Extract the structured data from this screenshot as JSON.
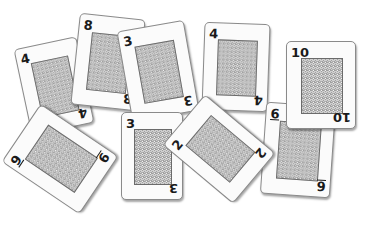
{
  "scene": {
    "description": "Scattered playing cards face-down showing rank numbers in corners",
    "background": "#ffffff"
  },
  "cards": [
    {
      "id": "card-4-left",
      "rank": "4",
      "x": 22,
      "y": 42,
      "w": 64,
      "h": 88,
      "rotate": -12,
      "z": 1
    },
    {
      "id": "card-8",
      "rank": "8",
      "x": 75,
      "y": 16,
      "w": 66,
      "h": 92,
      "rotate": 6,
      "z": 2
    },
    {
      "id": "card-3-top",
      "rank": "3",
      "x": 124,
      "y": 25,
      "w": 68,
      "h": 92,
      "rotate": -10,
      "z": 3
    },
    {
      "id": "card-4-right",
      "rank": "4",
      "x": 203,
      "y": 23,
      "w": 66,
      "h": 88,
      "rotate": 2,
      "z": 3
    },
    {
      "id": "card-6",
      "rank": "6",
      "x": 263,
      "y": 104,
      "w": 70,
      "h": 92,
      "rotate": 4,
      "z": 4
    },
    {
      "id": "card-10",
      "rank": "10",
      "x": 286,
      "y": 41,
      "w": 70,
      "h": 88,
      "rotate": 0,
      "z": 5
    },
    {
      "id": "card-9",
      "rank": "9",
      "x": 25,
      "y": 112,
      "w": 70,
      "h": 94,
      "rotate": -56,
      "z": 6
    },
    {
      "id": "card-3-bottom",
      "rank": "3",
      "x": 121,
      "y": 112,
      "w": 62,
      "h": 88,
      "rotate": 0,
      "z": 7
    },
    {
      "id": "card-2",
      "rank": "2",
      "x": 186,
      "y": 103,
      "w": 66,
      "h": 92,
      "rotate": -50,
      "z": 8
    }
  ]
}
